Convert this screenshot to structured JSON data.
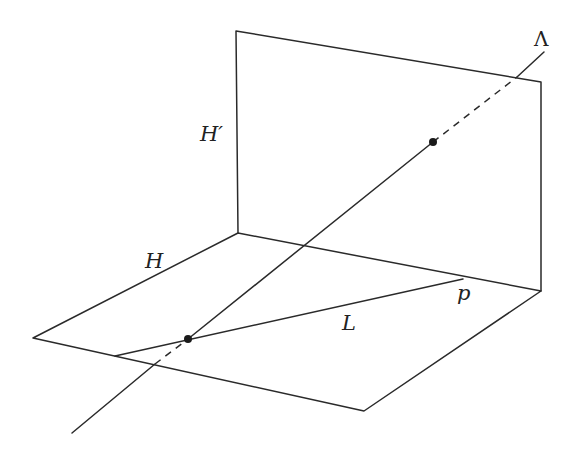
{
  "figure": {
    "labels": {
      "vertical_plane": "H′",
      "horizontal_plane": "H",
      "line_lambda": "Λ",
      "line_L": "L",
      "point_p": "p"
    },
    "planes": {
      "vertical_H_prime": [
        [
          236,
          31
        ],
        [
          541,
          82
        ],
        [
          541,
          291
        ],
        [
          238,
          233
        ]
      ],
      "horizontal_H": [
        [
          238,
          233
        ],
        [
          541,
          291
        ],
        [
          364,
          411
        ],
        [
          33,
          338
        ]
      ]
    },
    "line_lambda": {
      "start": [
        72,
        433
      ],
      "end": [
        544,
        52
      ],
      "dots": [
        [
          188,
          339
        ],
        [
          433,
          142
        ]
      ],
      "hidden_segments": [
        [
          [
            155,
            364
          ],
          [
            188,
            339
          ]
        ],
        [
          [
            433,
            142
          ],
          [
            517,
            77
          ]
        ]
      ]
    },
    "line_L": {
      "start": [
        115,
        356
      ],
      "through": [
        188,
        339
      ],
      "end": [
        463,
        279
      ]
    },
    "colors": {
      "stroke": "#2a2a2a",
      "background": "#ffffff"
    }
  }
}
